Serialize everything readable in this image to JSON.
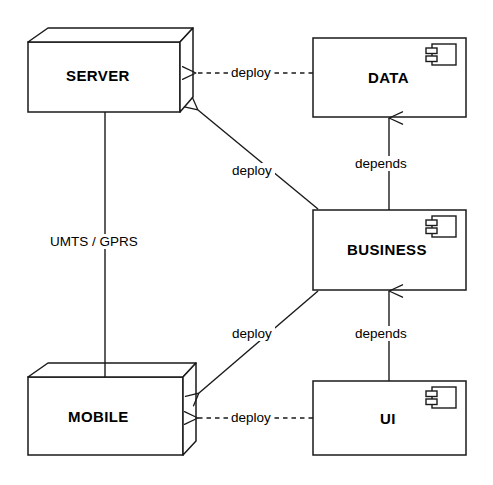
{
  "diagram": {
    "type": "uml-deployment",
    "background_color": "#ffffff",
    "stroke_color": "#1a1a1a",
    "nodes": [
      {
        "id": "server",
        "label": "SERVER",
        "shape": "node-3d-box"
      },
      {
        "id": "mobile",
        "label": "MOBILE",
        "shape": "node-3d-box"
      },
      {
        "id": "data",
        "label": "DATA",
        "shape": "component"
      },
      {
        "id": "business",
        "label": "BUSINESS",
        "shape": "component"
      },
      {
        "id": "ui",
        "label": "UI",
        "shape": "component"
      }
    ],
    "edges": [
      {
        "id": "data-to-server",
        "label": "deploy",
        "from": "data",
        "to": "server",
        "style": "dashed",
        "arrow": "open"
      },
      {
        "id": "business-to-server",
        "label": "deploy",
        "from": "business",
        "to": "server",
        "style": "solid",
        "arrow": "open"
      },
      {
        "id": "business-to-mobile",
        "label": "deploy",
        "from": "business",
        "to": "mobile",
        "style": "solid",
        "arrow": "open"
      },
      {
        "id": "ui-to-mobile",
        "label": "deploy",
        "from": "ui",
        "to": "mobile",
        "style": "dashed",
        "arrow": "open"
      },
      {
        "id": "business-to-data",
        "label": "depends",
        "from": "business",
        "to": "data",
        "style": "solid",
        "arrow": "open"
      },
      {
        "id": "ui-to-business",
        "label": "depends",
        "from": "ui",
        "to": "business",
        "style": "solid",
        "arrow": "open"
      },
      {
        "id": "server-to-mobile",
        "label": "UMTS / GPRS",
        "from": "server",
        "to": "mobile",
        "style": "solid",
        "arrow": "none"
      }
    ]
  }
}
